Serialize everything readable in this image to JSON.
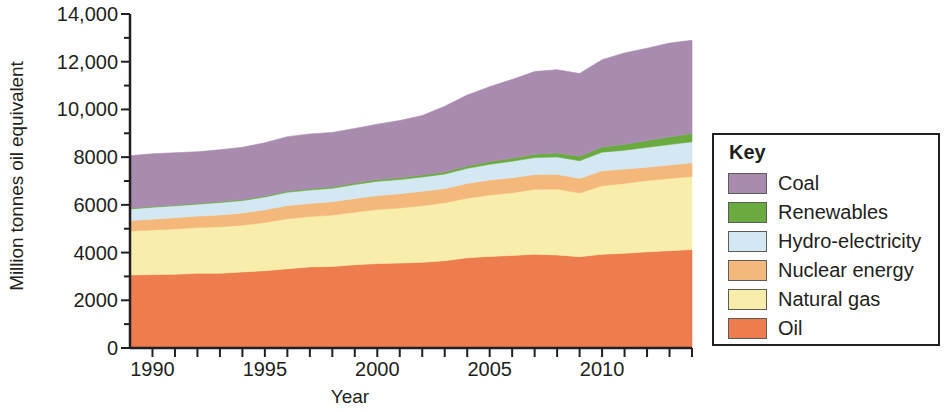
{
  "chart_data": {
    "type": "area",
    "stacked": true,
    "title": "",
    "xlabel": "Year",
    "ylabel": "Million tonnes oil equivalent",
    "xlim": [
      1989,
      2014
    ],
    "ylim": [
      0,
      14000
    ],
    "grid": false,
    "legend_position": "right",
    "legend_title": "Key",
    "x": [
      1989,
      1990,
      1991,
      1992,
      1993,
      1994,
      1995,
      1996,
      1997,
      1998,
      1999,
      2000,
      2001,
      2002,
      2003,
      2004,
      2005,
      2006,
      2007,
      2008,
      2009,
      2010,
      2011,
      2012,
      2013,
      2014
    ],
    "y_ticks": [
      0,
      2000,
      4000,
      6000,
      8000,
      10000,
      12000,
      14000
    ],
    "y_tick_labels": [
      "0",
      "2000",
      "4000",
      "6000",
      "8000",
      "10,000",
      "12,000",
      "14,000"
    ],
    "x_ticks_labeled": [
      1990,
      1995,
      2000,
      2005,
      2010
    ],
    "x_tick_labels": [
      "1990",
      "1995",
      "2000",
      "2005",
      "2010"
    ],
    "stack_order_bottom_to_top": [
      "Oil",
      "Natural gas",
      "Nuclear energy",
      "Hydro-electricity",
      "Renewables",
      "Coal"
    ],
    "series": [
      {
        "name": "Oil",
        "color": "#ed7d4e",
        "values": [
          3060,
          3080,
          3090,
          3130,
          3130,
          3190,
          3240,
          3320,
          3400,
          3420,
          3490,
          3540,
          3560,
          3590,
          3660,
          3780,
          3840,
          3880,
          3930,
          3900,
          3830,
          3930,
          3970,
          4030,
          4080,
          4130
        ]
      },
      {
        "name": "Natural gas",
        "color": "#f8edaa",
        "values": [
          1840,
          1870,
          1900,
          1920,
          1950,
          1960,
          2020,
          2100,
          2110,
          2150,
          2200,
          2270,
          2310,
          2370,
          2430,
          2500,
          2570,
          2630,
          2720,
          2760,
          2670,
          2870,
          2930,
          2990,
          3030,
          3060
        ]
      },
      {
        "name": "Nuclear energy",
        "color": "#f4b87a",
        "values": [
          440,
          450,
          470,
          480,
          500,
          510,
          530,
          550,
          550,
          560,
          580,
          580,
          600,
          610,
          600,
          620,
          630,
          630,
          620,
          620,
          610,
          630,
          600,
          560,
          560,
          570
        ]
      },
      {
        "name": "Hydro-electricity",
        "color": "#d4e8f3",
        "values": [
          490,
          500,
          500,
          500,
          520,
          520,
          540,
          560,
          560,
          570,
          580,
          600,
          590,
          600,
          600,
          630,
          660,
          690,
          710,
          730,
          740,
          780,
          790,
          830,
          860,
          880
        ]
      },
      {
        "name": "Renewables",
        "color": "#6aab3f",
        "values": [
          30,
          32,
          34,
          36,
          40,
          42,
          46,
          50,
          54,
          58,
          64,
          70,
          76,
          84,
          92,
          102,
          114,
          128,
          146,
          168,
          186,
          216,
          250,
          285,
          320,
          350
        ]
      },
      {
        "name": "Coal",
        "color": "#a98bb0",
        "values": [
          2200,
          2210,
          2190,
          2160,
          2170,
          2190,
          2230,
          2280,
          2300,
          2280,
          2290,
          2320,
          2400,
          2490,
          2750,
          2970,
          3140,
          3300,
          3460,
          3490,
          3470,
          3660,
          3830,
          3870,
          3930,
          3910
        ]
      }
    ]
  },
  "legend": {
    "title": "Key",
    "items": [
      {
        "label": "Coal",
        "color": "#a98bb0"
      },
      {
        "label": "Renewables",
        "color": "#6aab3f"
      },
      {
        "label": "Hydro-electricity",
        "color": "#d4e8f3"
      },
      {
        "label": "Nuclear energy",
        "color": "#f4b87a"
      },
      {
        "label": "Natural gas",
        "color": "#f8edaa"
      },
      {
        "label": "Oil",
        "color": "#ed7d4e"
      }
    ]
  },
  "axes": {
    "y_title": "Million tonnes oil equivalent",
    "x_title": "Year"
  },
  "colors": {
    "axis": "#231f20",
    "background": "#ffffff"
  }
}
